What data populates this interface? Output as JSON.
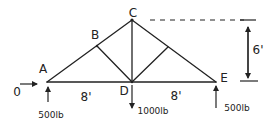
{
  "diagram": {
    "type": "truss",
    "colors": {
      "ink": "#222222",
      "background": "#ffffff"
    },
    "nodes": [
      {
        "id": "A",
        "label": "A",
        "x": 47,
        "y": 82
      },
      {
        "id": "B",
        "label": "B",
        "x": 97,
        "y": 46
      },
      {
        "id": "C",
        "label": "C",
        "x": 132,
        "y": 20
      },
      {
        "id": "D",
        "label": "D",
        "x": 132,
        "y": 82
      },
      {
        "id": "E",
        "label": "E",
        "x": 216,
        "y": 82
      }
    ],
    "members": [
      [
        "A",
        "B"
      ],
      [
        "B",
        "C"
      ],
      [
        "C",
        "E"
      ],
      [
        "A",
        "D"
      ],
      [
        "D",
        "E"
      ],
      [
        "B",
        "D"
      ],
      [
        "C",
        "D"
      ],
      [
        "D",
        "F"
      ]
    ],
    "dimensions": {
      "left_span": "8'",
      "right_span": "8'",
      "height": "6'"
    },
    "loads": {
      "A_horizontal": "0",
      "A_vertical": "500lb",
      "D_vertical": "1000lb",
      "E_vertical": "500lb"
    }
  }
}
